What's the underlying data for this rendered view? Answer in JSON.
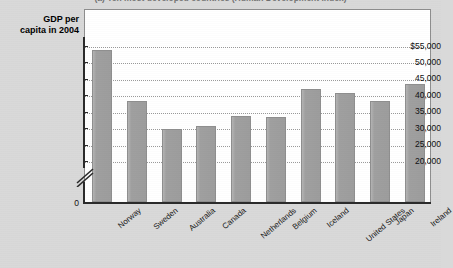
{
  "figure": {
    "panel_title": "(a) Ten most developed countries (Human Development Index)",
    "axis_title_line1": "GDP per",
    "axis_title_line2": "capita in 2004"
  },
  "chart_data": {
    "type": "bar",
    "title": "(a) Ten most developed countries (Human Development Index)",
    "xlabel": "",
    "ylabel": "GDP per capita in 2004",
    "categories": [
      "Norway",
      "Sweden",
      "Australia",
      "Canada",
      "Netherlands",
      "Belgium",
      "Iceland",
      "United States",
      "Japan",
      "Ireland"
    ],
    "values": [
      53500,
      38000,
      29500,
      30500,
      33500,
      33000,
      41500,
      40500,
      38000,
      43000
    ],
    "ytick_labels": [
      "$55,000",
      "50,000",
      "45,000",
      "40,000",
      "35,000",
      "30,000",
      "25,000",
      "20,000",
      "0"
    ],
    "ytick_values": [
      55000,
      50000,
      45000,
      40000,
      35000,
      30000,
      25000,
      20000,
      0
    ],
    "ylim": [
      18000,
      57000
    ],
    "axis_break": true,
    "axis_break_note": "y-axis broken between 0 and 20,000",
    "grid": true,
    "grid_axis": "y",
    "legend": "none",
    "bar_color": "#a3a3a3",
    "plot_background": "#ffffff",
    "figure_background": "#d9d9d9"
  }
}
